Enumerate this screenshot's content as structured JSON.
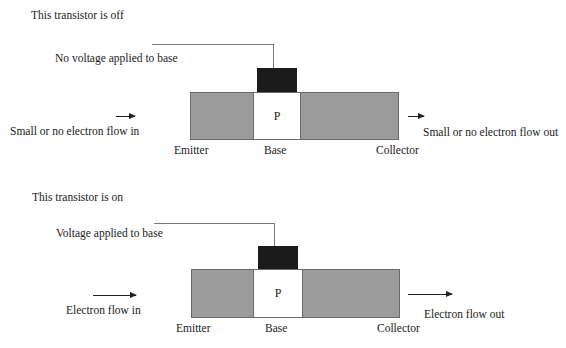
{
  "diagrams": [
    {
      "state": "off",
      "title": "This transistor is off",
      "base_label": "No voltage applied to base",
      "flow_in": "Small or no electron flow in",
      "flow_out": "Small or no electron flow out",
      "regions": {
        "emitter": "Emitter",
        "base": "Base",
        "collector": "Collector",
        "base_doping": "P"
      }
    },
    {
      "state": "on",
      "title": "This transistor is on",
      "base_label": "Voltage applied to base",
      "flow_in": "Electron flow in",
      "flow_out": "Electron flow out",
      "regions": {
        "emitter": "Emitter",
        "base": "Base",
        "collector": "Collector",
        "base_doping": "P"
      }
    }
  ],
  "colors": {
    "n_region": "#9b9b9b",
    "p_region": "#ffffff",
    "base_contact": "#1b1b1b",
    "wire": "#7a7a7a",
    "text": "#222222"
  }
}
